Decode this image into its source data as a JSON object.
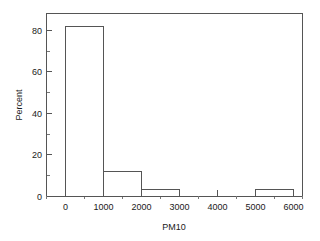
{
  "chart_data": {
    "type": "bar",
    "title": "",
    "subtitle": "",
    "xlabel": "PM10",
    "ylabel": "Percent",
    "xlim": [
      -500,
      6550
    ],
    "ylim": [
      0,
      88
    ],
    "grid": false,
    "legend": null,
    "bin_width": 1000,
    "categories": [
      "0-1000",
      "1000-2000",
      "2000-3000",
      "3000-4000",
      "4000-5000",
      "5000-6000"
    ],
    "bin_edges": [
      0,
      1000,
      2000,
      3000,
      4000,
      5000,
      6000
    ],
    "values": [
      81.5,
      12,
      3,
      0,
      0,
      3
    ],
    "x_tick_labels": [
      "0",
      "1000",
      "2000",
      "3000",
      "4000",
      "5000",
      "6000"
    ],
    "x_tick_values": [
      0,
      1000,
      2000,
      3000,
      4000,
      5000,
      6000
    ],
    "x_minor_tick_values": [
      -500,
      500,
      1500,
      2500,
      3500,
      4500,
      5500,
      6500
    ],
    "y_tick_labels": [
      "0",
      "20",
      "40",
      "60",
      "80"
    ],
    "y_tick_values": [
      0,
      20,
      40,
      60,
      80
    ],
    "y_minor_tick_values": [
      10,
      30,
      50,
      70
    ],
    "colors": {
      "bar_fill": "#ffffff",
      "bar_stroke": "#555555",
      "axis": "#555555",
      "text": "#1a1a1a",
      "background": "#ffffff"
    }
  },
  "axes": {
    "x_title": "PM10",
    "y_title": "Percent"
  }
}
